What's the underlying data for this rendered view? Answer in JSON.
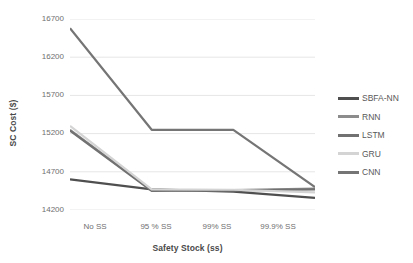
{
  "chart_data": {
    "type": "line",
    "title": "",
    "xlabel": "Safety Stock (ss)",
    "ylabel": "SC Cost ($)",
    "categories": [
      "No SS",
      "95 % SS",
      "99% SS",
      "99.9% SS"
    ],
    "ylim": [
      14200,
      16700
    ],
    "yticks": [
      14200,
      14700,
      15200,
      15700,
      16200,
      16700
    ],
    "grid": true,
    "legend_position": "right",
    "series": [
      {
        "name": "SBFA-NN",
        "color": "#4f4f4f",
        "values": [
          14600,
          14470,
          14440,
          14360
        ]
      },
      {
        "name": "RNN",
        "color": "#8c8c8c",
        "values": [
          15250,
          14460,
          14460,
          14480
        ]
      },
      {
        "name": "LSTM",
        "color": "#717171",
        "values": [
          15240,
          14450,
          14455,
          14470
        ]
      },
      {
        "name": "GRU",
        "color": "#d4d4d4",
        "values": [
          15300,
          14470,
          14465,
          14430
        ]
      },
      {
        "name": "CNN",
        "color": "#757575",
        "values": [
          16580,
          15250,
          15250,
          14500
        ]
      }
    ]
  },
  "legend": {
    "items": [
      {
        "label": "SBFA-NN"
      },
      {
        "label": "RNN"
      },
      {
        "label": "LSTM"
      },
      {
        "label": "GRU"
      },
      {
        "label": "CNN"
      }
    ]
  },
  "axes": {
    "y_tick_labels": [
      "16700",
      "16200",
      "15700",
      "15200",
      "14700",
      "14200"
    ],
    "x_tick_labels": [
      "No SS",
      "95 % SS",
      "99% SS",
      "99.9% SS"
    ],
    "x_title": "Safety Stock (ss)",
    "y_title": "SC Cost ($)"
  }
}
